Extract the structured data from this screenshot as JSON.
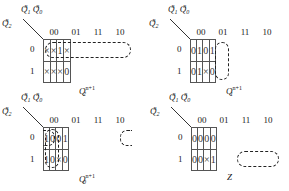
{
  "figure": {
    "title": "",
    "variables": {
      "row_var": "Q2",
      "col_vars": "Q1 Q0",
      "row_label_html": "Q<sub>2</sub><sup>n</sup>",
      "col_headers": [
        "00",
        "01",
        "11",
        "10"
      ],
      "row_headers": [
        "0",
        "1"
      ]
    },
    "maps": [
      {
        "id": "q2",
        "function_label": "Q",
        "function_sub": "2",
        "function_sup": "n+1",
        "cells": [
          [
            "×",
            "×",
            "1",
            "×"
          ],
          [
            "×",
            "×",
            "×",
            "0"
          ]
        ],
        "groups": [
          {
            "desc": "row 0, all four columns",
            "cells": [
              [
                0,
                0
              ],
              [
                0,
                1
              ],
              [
                0,
                2
              ],
              [
                0,
                3
              ]
            ]
          }
        ]
      },
      {
        "id": "q1",
        "function_label": "Q",
        "function_sub": "1",
        "function_sup": "n+1",
        "cells": [
          [
            "0",
            "1",
            "0",
            "1"
          ],
          [
            "0",
            "1",
            "×",
            "0"
          ]
        ],
        "groups": [
          {
            "desc": "column 01, both rows",
            "cells": [
              [
                0,
                1
              ],
              [
                1,
                1
              ]
            ]
          }
        ]
      },
      {
        "id": "q0",
        "function_label": "Q",
        "function_sub": "0",
        "function_sup": "n+1",
        "cells": [
          [
            "1",
            "0",
            "0",
            "1"
          ],
          [
            "1",
            "0",
            "×",
            "0"
          ]
        ],
        "groups": [
          {
            "desc": "column 00, both rows",
            "cells": [
              [
                0,
                0
              ],
              [
                1,
                0
              ]
            ]
          },
          {
            "desc": "row 0, columns 00 and 10 (wrap-around)",
            "cells": [
              [
                0,
                0
              ],
              [
                0,
                3
              ]
            ]
          }
        ]
      },
      {
        "id": "z",
        "function_label": "Z",
        "function_sub": "",
        "function_sup": "",
        "cells": [
          [
            "0",
            "0",
            "0",
            "0"
          ],
          [
            "0",
            "0",
            "×",
            "1"
          ]
        ],
        "groups": [
          {
            "desc": "row 1, columns 11 and 10",
            "cells": [
              [
                1,
                2
              ],
              [
                1,
                3
              ]
            ]
          }
        ]
      }
    ]
  },
  "labels": {
    "Q": "Q",
    "n": "n",
    "sub1": "1",
    "sub0": "0",
    "sub2": "2"
  }
}
